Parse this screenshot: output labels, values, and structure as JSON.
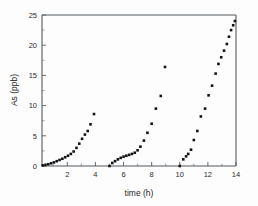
{
  "chart_data": {
    "type": "scatter",
    "title": "",
    "xlabel": "time (h)",
    "ylabel": "As (ppb)",
    "xlim": [
      0.2,
      14
    ],
    "ylim": [
      0,
      25
    ],
    "xticks": [
      2,
      4,
      6,
      8,
      10,
      12,
      14
    ],
    "xticklabels": [
      "2",
      "4",
      "6",
      "8",
      "10",
      "12",
      "14"
    ],
    "xminorticks": [
      1,
      3,
      5,
      7,
      9,
      11,
      13
    ],
    "yticks": [
      0,
      5,
      10,
      15,
      20,
      25
    ],
    "yticklabels": [
      "0",
      "5",
      "10",
      "15",
      "20",
      "25"
    ],
    "yminorticks": [
      2.5,
      7.5,
      12.5,
      17.5,
      22.5
    ],
    "grid": false,
    "legend": false,
    "marker": "square",
    "marker_color": "#141414",
    "marker_size": 2.6,
    "series": [
      {
        "name": "cycle 1",
        "x": [
          0.25,
          0.45,
          0.65,
          0.85,
          1.05,
          1.25,
          1.45,
          1.65,
          1.85,
          2.05,
          2.25,
          2.45,
          2.65,
          2.85,
          3.05,
          3.25,
          3.45,
          3.65,
          3.9
        ],
        "y": [
          0.1,
          0.2,
          0.3,
          0.45,
          0.6,
          0.8,
          1.0,
          1.2,
          1.45,
          1.7,
          2.0,
          2.4,
          3.0,
          3.7,
          4.5,
          5.2,
          5.8,
          6.9,
          8.6
        ]
      },
      {
        "name": "cycle 2",
        "x": [
          5.0,
          5.2,
          5.4,
          5.6,
          5.8,
          6.0,
          6.2,
          6.4,
          6.6,
          6.8,
          7.0,
          7.2,
          7.45,
          7.7,
          8.0,
          8.3,
          8.65,
          8.95
        ],
        "y": [
          0.0,
          0.5,
          0.8,
          1.1,
          1.35,
          1.55,
          1.7,
          1.85,
          2.0,
          2.2,
          2.6,
          3.2,
          4.2,
          5.5,
          7.0,
          9.5,
          11.6,
          16.4
        ]
      },
      {
        "name": "cycle 3",
        "x": [
          10.0,
          10.25,
          10.45,
          10.6,
          10.8,
          11.0,
          11.25,
          11.5,
          11.8,
          12.05,
          12.3,
          12.55,
          12.75,
          12.95,
          13.15,
          13.35,
          13.5,
          13.65,
          13.8,
          13.92
        ],
        "y": [
          0.0,
          1.1,
          1.6,
          2.0,
          2.7,
          4.3,
          5.8,
          8.2,
          9.5,
          11.7,
          13.3,
          15.3,
          16.9,
          18.0,
          19.1,
          20.2,
          21.4,
          22.5,
          23.3,
          24.0
        ]
      }
    ]
  }
}
